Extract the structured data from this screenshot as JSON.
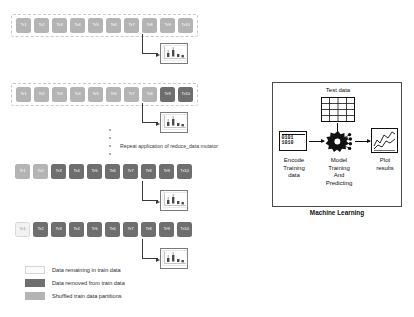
{
  "diagram": {
    "repeat_note": "Repeat application of reduce_data mutator",
    "block_prefix": "Tr",
    "rows": [
      {
        "name": "row-1-shuffled-partitions",
        "blocks": [
          {
            "label": "Tr1",
            "state": "shuffled"
          },
          {
            "label": "Tr2",
            "state": "shuffled"
          },
          {
            "label": "Tr3",
            "state": "shuffled"
          },
          {
            "label": "Tr4",
            "state": "shuffled"
          },
          {
            "label": "Tr5",
            "state": "shuffled"
          },
          {
            "label": "Tr6",
            "state": "shuffled"
          },
          {
            "label": "Tr7",
            "state": "shuffled"
          },
          {
            "label": "Tr8",
            "state": "shuffled"
          },
          {
            "label": "Tr9",
            "state": "shuffled"
          },
          {
            "label": "Tr10",
            "state": "shuffled"
          }
        ]
      },
      {
        "name": "row-2-one-removed",
        "blocks": [
          {
            "label": "Tr1",
            "state": "shuffled"
          },
          {
            "label": "Tr2",
            "state": "shuffled"
          },
          {
            "label": "Tr3",
            "state": "shuffled"
          },
          {
            "label": "Tr4",
            "state": "shuffled"
          },
          {
            "label": "Tr5",
            "state": "shuffled"
          },
          {
            "label": "Tr6",
            "state": "shuffled"
          },
          {
            "label": "Tr7",
            "state": "shuffled"
          },
          {
            "label": "Tr8",
            "state": "shuffled"
          },
          {
            "label": "Tr9",
            "state": "removed"
          },
          {
            "label": "Tr10",
            "state": "removed"
          }
        ]
      },
      {
        "name": "row-3-more-removed",
        "blocks": [
          {
            "label": "Tr1",
            "state": "shuffled"
          },
          {
            "label": "Tr2",
            "state": "shuffled"
          },
          {
            "label": "Tr3",
            "state": "removed"
          },
          {
            "label": "Tr4",
            "state": "removed"
          },
          {
            "label": "Tr5",
            "state": "removed"
          },
          {
            "label": "Tr6",
            "state": "removed"
          },
          {
            "label": "Tr7",
            "state": "removed"
          },
          {
            "label": "Tr8",
            "state": "removed"
          },
          {
            "label": "Tr9",
            "state": "removed"
          },
          {
            "label": "Tr10",
            "state": "removed"
          }
        ]
      },
      {
        "name": "row-4-one-remaining",
        "blocks": [
          {
            "label": "Tr1",
            "state": "remain"
          },
          {
            "label": "Tr2",
            "state": "removed"
          },
          {
            "label": "Tr3",
            "state": "removed"
          },
          {
            "label": "Tr4",
            "state": "removed"
          },
          {
            "label": "Tr5",
            "state": "removed"
          },
          {
            "label": "Tr6",
            "state": "removed"
          },
          {
            "label": "Tr7",
            "state": "removed"
          },
          {
            "label": "Tr8",
            "state": "removed"
          },
          {
            "label": "Tr9",
            "state": "removed"
          },
          {
            "label": "Tr10",
            "state": "removed"
          }
        ]
      }
    ]
  },
  "legend": {
    "items": [
      {
        "swatch": "remain",
        "label": "Data remaining in train data"
      },
      {
        "swatch": "removed",
        "label": "Data removed from train data"
      },
      {
        "swatch": "shuffled",
        "label": "Shuffled train data partitions"
      }
    ]
  },
  "ml_panel": {
    "title": "Machine Learning",
    "test_data_label": "Test data",
    "encode_label": "Encode\nTraining\ndata",
    "model_label": "Model\nTraining\nAnd\nPredicting",
    "plot_label": "Plot\nresults",
    "binary_top": "0101",
    "binary_bottom": "1010"
  },
  "colors": {
    "shuffled": "#b4b4b4",
    "removed": "#6e6e6e",
    "remaining": "#f2f2f2",
    "stroke": "#3a3a3a",
    "panel_border": "#4a4a4a",
    "background": "#ffffff"
  }
}
